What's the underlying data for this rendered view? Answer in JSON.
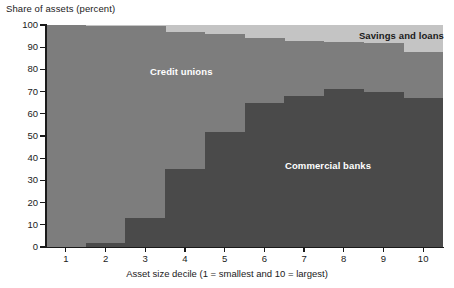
{
  "chart_data": {
    "type": "area",
    "title": "Share of assets (percent)",
    "xlabel": "Asset size decile (1 = smallest and 10 = largest)",
    "ylabel": "Share of assets (percent)",
    "categories": [
      "1",
      "2",
      "3",
      "4",
      "5",
      "6",
      "7",
      "8",
      "9",
      "10"
    ],
    "xticklabels": [
      "1",
      "2",
      "3",
      "4",
      "5",
      "6",
      "7",
      "8",
      "9",
      "10"
    ],
    "yticklabels": [
      "0",
      "10",
      "20",
      "30",
      "40",
      "50",
      "60",
      "70",
      "80",
      "90",
      "100"
    ],
    "yticks": [
      0,
      10,
      20,
      30,
      40,
      50,
      60,
      70,
      80,
      90,
      100
    ],
    "ylim": [
      0,
      100
    ],
    "grid": false,
    "legend": "in-plot-labels",
    "stacked": true,
    "step": true,
    "series": [
      {
        "name": "Commercial banks",
        "color": "#4a4a4a",
        "values": [
          0,
          2,
          13,
          35,
          52,
          65,
          68,
          71,
          70,
          67
        ]
      },
      {
        "name": "Credit unions",
        "color": "#7d7d7d",
        "values": [
          100,
          97.5,
          86.5,
          62,
          44,
          29,
          25,
          21.5,
          22,
          21
        ]
      },
      {
        "name": "Savings and loans",
        "color": "#c4c4c4",
        "values": [
          0,
          0.5,
          0.5,
          3,
          4,
          6,
          7,
          7.5,
          8,
          12
        ]
      }
    ],
    "cumulative_upper_bounds": {
      "commercial_banks": [
        0,
        2,
        13,
        35,
        52,
        65,
        68,
        71,
        70,
        67
      ],
      "credit_unions_top": [
        100,
        99.5,
        99.5,
        97,
        96,
        94,
        93,
        92.5,
        92,
        88
      ],
      "savings_and_loans_top": [
        100,
        100,
        100,
        100,
        100,
        100,
        100,
        100,
        100,
        100
      ]
    },
    "annotations": [
      {
        "text": "Savings and loans",
        "color": "#1a1a1a"
      },
      {
        "text": "Credit unions",
        "color": "#ffffff"
      },
      {
        "text": "Commercial banks",
        "color": "#ffffff"
      }
    ]
  },
  "colors": {
    "commercial_banks": "#4a4a4a",
    "credit_unions": "#7d7d7d",
    "savings_and_loans": "#c4c4c4",
    "axis": "#1a1a1a",
    "background": "#ffffff"
  },
  "labels": {
    "savings_and_loans": "Savings and loans",
    "credit_unions": "Credit unions",
    "commercial_banks": "Commercial banks"
  }
}
